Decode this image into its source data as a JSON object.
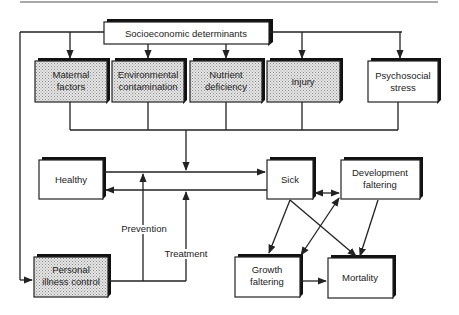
{
  "diagram": {
    "colors": {
      "line": "#222222",
      "shaded_fill": "#d8d8d8",
      "plain_fill": "#ffffff",
      "shadow": "#111111"
    },
    "nodes": {
      "socioeconomic": {
        "lines": [
          "Socioeconomic determinants"
        ],
        "shaded": false
      },
      "maternal": {
        "lines": [
          "Maternal",
          "factors"
        ],
        "shaded": true
      },
      "environmental": {
        "lines": [
          "Environmental",
          "contamination"
        ],
        "shaded": true
      },
      "nutrient": {
        "lines": [
          "Nutrient",
          "deficiency"
        ],
        "shaded": true
      },
      "injury": {
        "lines": [
          "Injury"
        ],
        "shaded": true
      },
      "psychosocial": {
        "lines": [
          "Psychosocial",
          "stress"
        ],
        "shaded": false
      },
      "healthy": {
        "lines": [
          "Healthy"
        ],
        "shaded": false
      },
      "sick": {
        "lines": [
          "Sick"
        ],
        "shaded": false
      },
      "development": {
        "lines": [
          "Development",
          "faltering"
        ],
        "shaded": false
      },
      "personal": {
        "lines": [
          "Personal",
          "illness control"
        ],
        "shaded": true
      },
      "growth": {
        "lines": [
          "Growth",
          "faltering"
        ],
        "shaded": false
      },
      "mortality": {
        "lines": [
          "Mortality"
        ],
        "shaded": false
      }
    },
    "edge_labels": {
      "prevention": "Prevention",
      "treatment": "Treatment"
    },
    "edges": [
      {
        "from": "socioeconomic",
        "to": "maternal"
      },
      {
        "from": "socioeconomic",
        "to": "environmental"
      },
      {
        "from": "socioeconomic",
        "to": "nutrient"
      },
      {
        "from": "socioeconomic",
        "to": "injury"
      },
      {
        "from": "socioeconomic",
        "to": "psychosocial"
      },
      {
        "from": "socioeconomic",
        "to": "personal"
      },
      {
        "from": "proximate-determinants",
        "to": "healthy-sick-transition"
      },
      {
        "from": "healthy",
        "to": "sick"
      },
      {
        "from": "sick",
        "to": "healthy"
      },
      {
        "from": "personal",
        "to": "healthy-to-sick",
        "label": "Prevention"
      },
      {
        "from": "personal",
        "to": "sick-to-healthy",
        "label": "Treatment"
      },
      {
        "from": "sick",
        "to": "development",
        "bidirectional": true
      },
      {
        "from": "sick",
        "to": "growth"
      },
      {
        "from": "sick",
        "to": "mortality"
      },
      {
        "from": "growth",
        "to": "development",
        "bidirectional": true
      },
      {
        "from": "development",
        "to": "mortality"
      },
      {
        "from": "growth",
        "to": "mortality"
      }
    ]
  }
}
